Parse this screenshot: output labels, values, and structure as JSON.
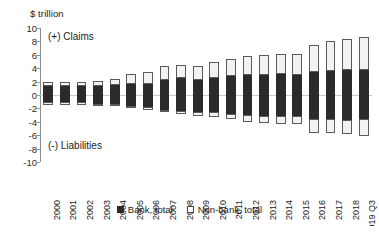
{
  "chart_data": {
    "type": "bar",
    "subtype": "stacked-diverging-bar",
    "title": "",
    "xlabel": "",
    "ylabel": "$ trillion",
    "ylim": [
      -10,
      10
    ],
    "ytick_step": 2,
    "yticks": [
      10,
      8,
      6,
      4,
      2,
      0,
      -2,
      -4,
      -6,
      -8,
      -10
    ],
    "grid": false,
    "zero_line": true,
    "legend_position": "bottom-center",
    "annotations": [
      {
        "text": "(+) Claims",
        "x": "2000",
        "y": 9
      },
      {
        "text": "(-) Liabilities",
        "x": "2000",
        "y": -7.5
      }
    ],
    "categories": [
      "2000",
      "2001",
      "2002",
      "2003",
      "2004",
      "2005",
      "2006",
      "2007",
      "2008",
      "2009",
      "2010",
      "2011",
      "2012",
      "2013",
      "2014",
      "2015",
      "2016",
      "2017",
      "2018",
      "2019 Q3"
    ],
    "series": [
      {
        "name": "Bank, total",
        "color": "#2b2b2b",
        "claims": [
          1.3,
          1.3,
          1.3,
          1.4,
          1.5,
          1.6,
          1.7,
          2.3,
          2.5,
          2.3,
          2.5,
          2.8,
          3.0,
          3.0,
          3.1,
          3.0,
          3.5,
          3.6,
          3.8,
          3.7
        ],
        "liabilities": [
          -1.0,
          -1.1,
          -1.1,
          -1.3,
          -1.4,
          -1.6,
          -1.8,
          -2.3,
          -2.4,
          -2.5,
          -2.6,
          -2.8,
          -3.0,
          -3.1,
          -3.2,
          -3.1,
          -3.6,
          -3.6,
          -3.7,
          -3.6
        ]
      },
      {
        "name": "Non-bank, total",
        "color": "#f2f2f2",
        "claims": [
          0.7,
          0.6,
          0.6,
          0.7,
          0.9,
          1.5,
          1.8,
          2.1,
          2.0,
          2.1,
          2.5,
          2.5,
          2.8,
          2.9,
          3.0,
          3.1,
          3.9,
          4.5,
          4.6,
          4.9
        ],
        "liabilities": [
          -0.5,
          -0.4,
          -0.4,
          -0.4,
          -0.3,
          -0.2,
          -0.5,
          -0.3,
          -0.5,
          -0.6,
          -0.7,
          -0.8,
          -1.1,
          -1.1,
          -1.2,
          -1.3,
          -2.0,
          -2.0,
          -2.1,
          -2.5
        ]
      }
    ],
    "totals": {
      "claims": [
        2.0,
        1.9,
        1.9,
        2.1,
        2.4,
        3.1,
        3.5,
        4.4,
        4.5,
        4.4,
        5.0,
        5.3,
        5.8,
        5.9,
        6.1,
        6.1,
        7.4,
        8.1,
        8.4,
        8.6
      ],
      "liabilities": [
        -1.5,
        -1.5,
        -1.5,
        -1.7,
        -1.7,
        -1.8,
        -2.3,
        -2.6,
        -2.9,
        -3.1,
        -3.3,
        -3.6,
        -4.1,
        -4.2,
        -4.4,
        -4.4,
        -5.6,
        -5.6,
        -5.8,
        -6.1
      ]
    }
  },
  "legend": {
    "items": [
      {
        "label": "Bank, total",
        "swatch": "filled-square-dark"
      },
      {
        "label": "Non-bank, total",
        "swatch": "hollow-square-light"
      }
    ]
  }
}
